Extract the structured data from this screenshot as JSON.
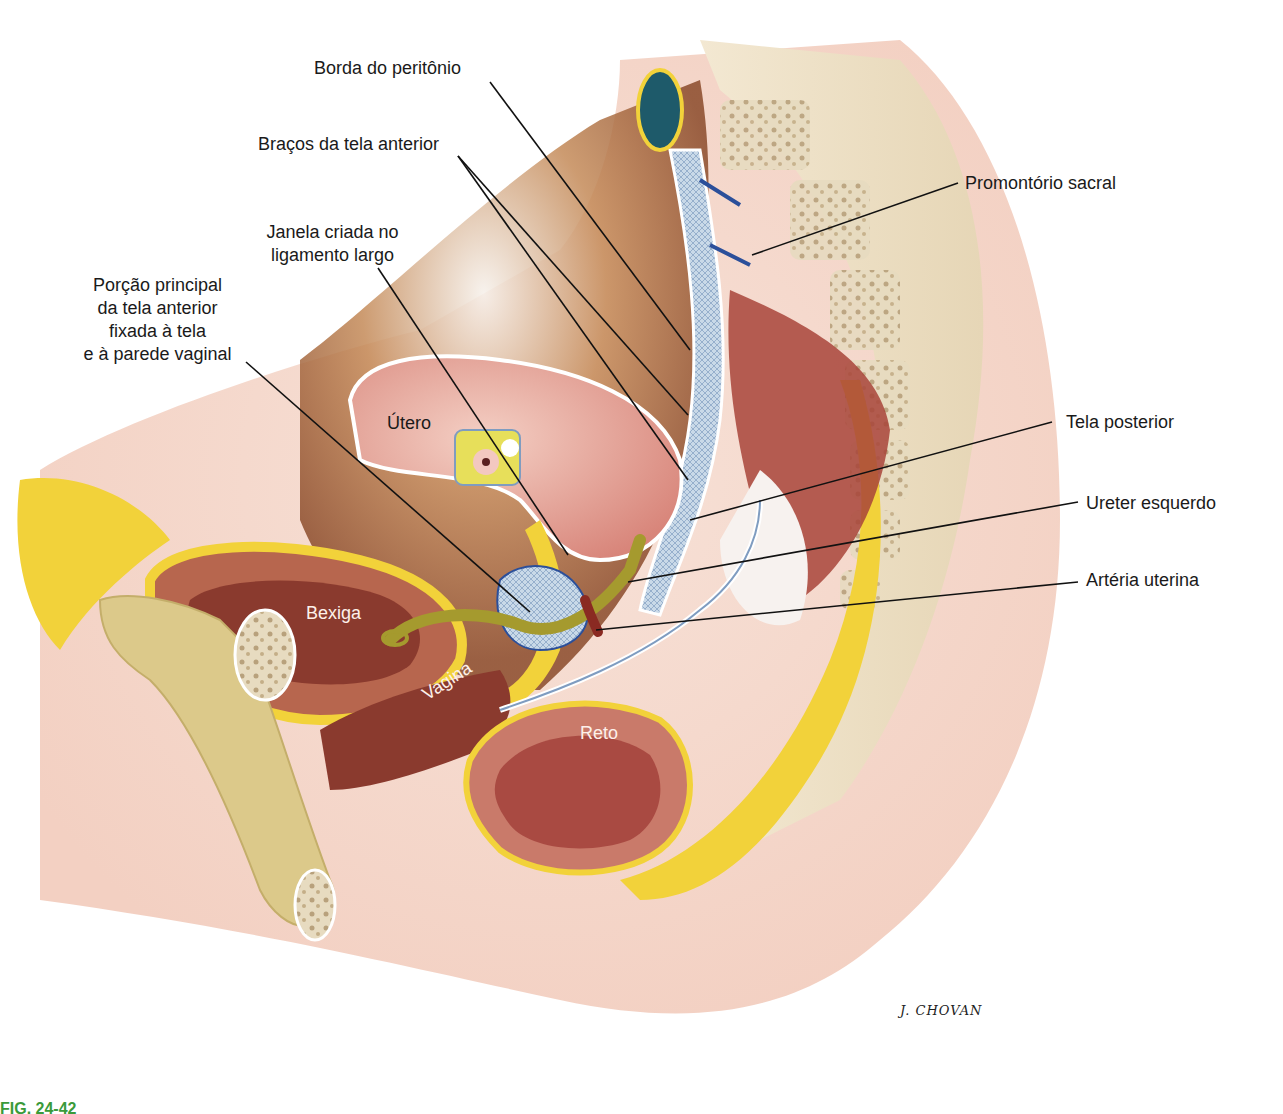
{
  "figure": {
    "signature": "J. CHOVAN",
    "caption_visible": "FIG. 24-42",
    "colors": {
      "background": "#ffffff",
      "skin": "#f3d2c4",
      "fat": "#f2d23a",
      "muscle": "#a8443a",
      "mesh": "#b9cde0",
      "ureter": "#a59a2e",
      "bone": "#e9dcc0",
      "leader_line": "#111111",
      "caption": "#3a9a3a"
    }
  },
  "labels": {
    "borda_peritonio": "Borda do peritônio",
    "bracos_tela_anterior": "Braços da tela anterior",
    "janela_ligamento": [
      "Janela criada no",
      "ligamento largo"
    ],
    "porcao_principal": [
      "Porção principal",
      "da tela anterior",
      "fixada à tela",
      "e à parede vaginal"
    ],
    "promontorio_sacral": "Promontório sacral",
    "tela_posterior": "Tela posterior",
    "ureter_esquerdo": "Ureter esquerdo",
    "arteria_uterina": "Artéria uterina"
  },
  "organs": {
    "utero": "Útero",
    "bexiga": "Bexiga",
    "vagina": "Vagina",
    "reto": "Reto"
  }
}
